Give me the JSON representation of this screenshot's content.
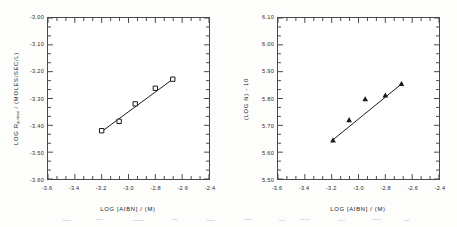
{
  "figure": {
    "background_color": "#ffffff",
    "axis_color": "#4a4a4a",
    "text_color": "#232323",
    "marker_color": "#1a1a1a"
  },
  "chart_data": [
    {
      "type": "scatter",
      "panel": "left",
      "title": "",
      "xlabel": "LOG [AIBN] / (M)",
      "ylabel": "LOG Rp,max / (MOLES/SEC/L)",
      "ylabel_main": "LOG R",
      "ylabel_sub": "p,max",
      "ylabel_tail": " / (MOLES/SEC/L)",
      "marker": "open-square",
      "line": true,
      "grid": false,
      "legend": false,
      "xlim": [
        -3.6,
        -2.4
      ],
      "ylim": [
        -3.6,
        -3.0
      ],
      "xticks": [
        -3.6,
        -3.4,
        -3.2,
        -3.0,
        -2.8,
        -2.6,
        -2.4
      ],
      "xtick_labels": [
        "-3.6",
        "-3.4",
        "-3.2",
        "-3.0",
        "-2.8",
        "-2.6",
        "-2.4"
      ],
      "yticks": [
        -3.0,
        -3.1,
        -3.2,
        -3.3,
        -3.4,
        -3.5,
        -3.6
      ],
      "ytick_labels": [
        "-3.00",
        "-3.10",
        "-3.20",
        "-3.30",
        "-3.40",
        "-3.50",
        "-3.60"
      ],
      "x_minor_per_interval": 2,
      "y_minor_per_interval": 2,
      "x": [
        -3.2,
        -3.07,
        -2.95,
        -2.8,
        -2.67
      ],
      "y": [
        -3.42,
        -3.385,
        -3.32,
        -3.262,
        -3.228
      ],
      "fit_line": {
        "x": [
          -3.2,
          -2.67
        ],
        "y": [
          -3.423,
          -3.228
        ]
      }
    },
    {
      "type": "scatter",
      "panel": "right",
      "title": "",
      "xlabel": "LOG [AIBN] / (M)",
      "ylabel": "(LOG N) - 10",
      "marker": "filled-triangle",
      "line": true,
      "grid": false,
      "legend": false,
      "xlim": [
        -3.6,
        -2.4
      ],
      "ylim": [
        5.5,
        6.1
      ],
      "xticks": [
        -3.6,
        -3.4,
        -3.2,
        -3.0,
        -2.8,
        -2.6,
        -2.4
      ],
      "xtick_labels": [
        "-3.6",
        "-3.4",
        "-3.2",
        "-3.0",
        "-2.8",
        "-2.6",
        "-2.4"
      ],
      "yticks": [
        6.1,
        6.0,
        5.9,
        5.8,
        5.7,
        5.6,
        5.5
      ],
      "ytick_labels": [
        "6.10",
        "6.00",
        "5.90",
        "5.80",
        "5.70",
        "5.60",
        "5.50"
      ],
      "x_minor_per_interval": 2,
      "y_minor_per_interval": 2,
      "x": [
        -3.19,
        -3.07,
        -2.95,
        -2.8,
        -2.68
      ],
      "y": [
        5.645,
        5.72,
        5.798,
        5.812,
        5.855
      ],
      "fit_line": {
        "x": [
          -3.2,
          -2.67
        ],
        "y": [
          5.642,
          5.858
        ]
      }
    }
  ]
}
